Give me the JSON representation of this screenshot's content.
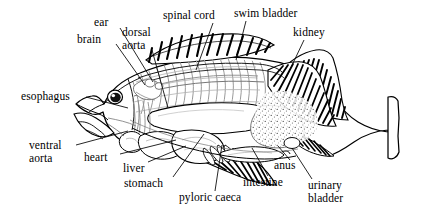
{
  "figure": {
    "style": "black-and-white line drawing with leader lines",
    "background_color": "#ffffff",
    "ink_color": "#000000",
    "shading_color": "#9a9a9a"
  },
  "labels": {
    "esophagus": "esophagus",
    "brain": "brain",
    "ear": "ear",
    "dorsal_aorta": "dorsal\naorta",
    "spinal_cord": "spinal cord",
    "swim_bladder": "swim bladder",
    "kidney": "kidney",
    "ventral_aorta": "ventral\naorta",
    "heart": "heart",
    "liver": "liver",
    "stomach": "stomach",
    "pyloric_caeca": "pyloric caeca",
    "intestine": "intestine",
    "anus": "anus",
    "urinary_bladder": "urinary\nbladder"
  },
  "parts": [
    {
      "name": "esophagus",
      "label": "esophagus",
      "side": "left",
      "leader": true
    },
    {
      "name": "brain",
      "label": "brain",
      "side": "top",
      "leader": true
    },
    {
      "name": "ear",
      "label": "ear",
      "side": "top",
      "leader": true
    },
    {
      "name": "dorsal-aorta",
      "label": "dorsal aorta",
      "side": "top",
      "leader": true
    },
    {
      "name": "spinal-cord",
      "label": "spinal cord",
      "side": "top",
      "leader": true
    },
    {
      "name": "swim-bladder",
      "label": "swim bladder",
      "side": "top",
      "leader": true
    },
    {
      "name": "kidney",
      "label": "kidney",
      "side": "top",
      "leader": true
    },
    {
      "name": "ventral-aorta",
      "label": "ventral aorta",
      "side": "bottom",
      "leader": true
    },
    {
      "name": "heart",
      "label": "heart",
      "side": "bottom",
      "leader": true
    },
    {
      "name": "liver",
      "label": "liver",
      "side": "bottom",
      "leader": true
    },
    {
      "name": "stomach",
      "label": "stomach",
      "side": "bottom",
      "leader": true
    },
    {
      "name": "pyloric-caeca",
      "label": "pyloric caeca",
      "side": "bottom",
      "leader": true
    },
    {
      "name": "intestine",
      "label": "intestine",
      "side": "bottom",
      "leader": true
    },
    {
      "name": "anus",
      "label": "anus",
      "side": "bottom",
      "leader": true
    },
    {
      "name": "urinary-bladder",
      "label": "urinary bladder",
      "side": "bottom",
      "leader": true
    }
  ]
}
